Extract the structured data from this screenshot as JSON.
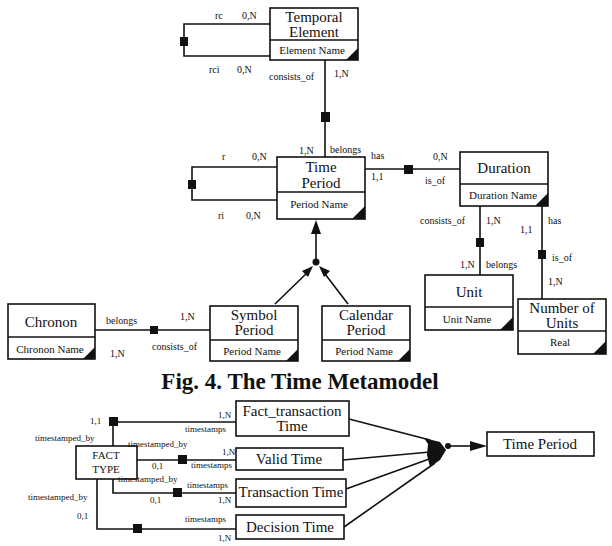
{
  "figure_caption": "Fig. 4. The Time Metamodel",
  "metamodel": {
    "entities": {
      "temporal_element": {
        "title1": "Temporal",
        "title2": "Element",
        "attr": "Element Name"
      },
      "time_period": {
        "title1": "Time",
        "title2": "Period",
        "attr": "Period Name"
      },
      "duration": {
        "title": "Duration",
        "attr": "Duration Name"
      },
      "unit": {
        "title": "Unit",
        "attr": "Unit Name"
      },
      "number_of_units": {
        "title1": "Number of",
        "title2": "Units",
        "attr": "Real"
      },
      "chronon": {
        "title": "Chronon",
        "attr": "Chronon Name"
      },
      "symbol_period": {
        "title1": "Symbol",
        "title2": "Period",
        "attr": "Period Name"
      },
      "calendar_period": {
        "title1": "Calendar",
        "title2": "Period",
        "attr": "Period Name"
      }
    },
    "relations": {
      "te_self": {
        "role_top": "rc",
        "card_top": "0,N",
        "role_bottom": "rci",
        "card_bottom": "0,N"
      },
      "te_tp": {
        "role_te": "consists_of",
        "card_te": "1,N",
        "role_tp": "belongs",
        "card_tp": "1,N"
      },
      "tp_self": {
        "role_top": "r",
        "card_top": "0,N",
        "role_bottom": "ri",
        "card_bottom": "0,N"
      },
      "tp_duration": {
        "role_tp": "has",
        "card_tp": "1,1",
        "role_dur": "is_of",
        "card_dur": "0,N"
      },
      "duration_unit": {
        "role_dur": "consists_of",
        "card_dur": "1,N",
        "role_unit": "belongs",
        "card_unit": "1,N"
      },
      "duration_nou": {
        "role_dur": "has",
        "card_dur": "1,1",
        "role_nou": "is_of",
        "card_nou": "1,N"
      },
      "chronon_symbol": {
        "role_chronon": "belongs",
        "card_chronon": "1,N",
        "role_symbol": "consists_of",
        "card_symbol": "1,N"
      }
    }
  },
  "fact_diagram": {
    "fact_type": {
      "line1": "FACT",
      "line2": "TYPE"
    },
    "targets": [
      {
        "line1": "Fact_transaction",
        "line2": "Time",
        "role_fact": "timestamped_by",
        "card_fact": "1,1",
        "role_time": "timestamps",
        "card_time": "1,N"
      },
      {
        "line1": "Valid Time",
        "role_fact": "timestamped_by",
        "card_fact": "0,1",
        "role_time": "timestamps",
        "card_time": "1,N"
      },
      {
        "line1": "Transaction Time",
        "role_fact": "timestamped_by",
        "card_fact": "0,1",
        "role_time": "timestamps",
        "card_time": "1,N"
      },
      {
        "line1": "Decision Time",
        "role_fact": "timestamped_by",
        "card_fact": "0,1",
        "role_time": "timestamps",
        "card_time": "1,N"
      }
    ],
    "supertype": "Time Period"
  }
}
